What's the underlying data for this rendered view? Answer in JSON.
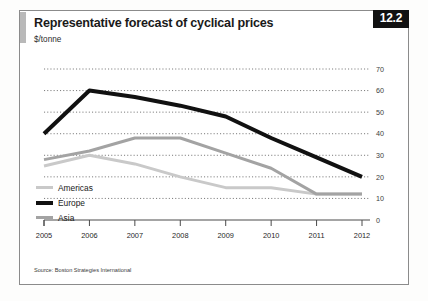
{
  "figure": {
    "badge": "12.2",
    "title": "Representative forecast of cyclical prices",
    "subtitle": "$/tonne",
    "source": "Source: Boston Strategies International"
  },
  "legend": {
    "position": "inside-bottom-left",
    "items": [
      {
        "label": "Americas",
        "color": "#c9c9c9"
      },
      {
        "label": "Europe",
        "color": "#111111"
      },
      {
        "label": "Asia",
        "color": "#a3a3a3"
      }
    ]
  },
  "chart_data": {
    "type": "line",
    "title": "Representative forecast of cyclical prices",
    "subtitle": "$/tonne",
    "xlabel": "",
    "ylabel": "$/tonne",
    "categories": [
      "2005",
      "2006",
      "2007",
      "2008",
      "2009",
      "2010",
      "2011",
      "2012"
    ],
    "x": [
      2005,
      2006,
      2007,
      2008,
      2009,
      2010,
      2011,
      2012
    ],
    "ylim": [
      0,
      70
    ],
    "yticks": [
      0,
      10,
      20,
      30,
      40,
      50,
      60,
      70
    ],
    "ytick_labels": [
      "0",
      "10",
      "20",
      "30",
      "40",
      "50",
      "60",
      "70"
    ],
    "y_axis_side": "right",
    "grid": "horizontal-dotted",
    "legend_position": "inside-bottom-left",
    "series": [
      {
        "name": "Americas",
        "color": "#c9c9c9",
        "width": 3,
        "values": [
          25,
          30,
          26,
          20,
          15,
          15,
          12,
          12
        ]
      },
      {
        "name": "Europe",
        "color": "#111111",
        "width": 4,
        "values": [
          40,
          60,
          57,
          53,
          48,
          38,
          29,
          20
        ]
      },
      {
        "name": "Asia",
        "color": "#a3a3a3",
        "width": 3,
        "values": [
          28,
          32,
          38,
          38,
          31,
          24,
          12,
          12
        ]
      }
    ]
  }
}
